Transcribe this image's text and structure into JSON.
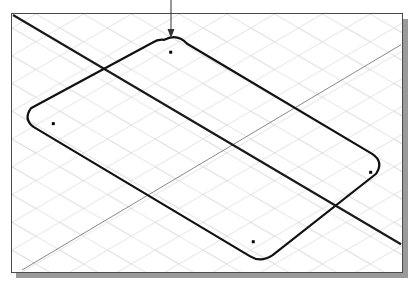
{
  "app": {
    "view_title": "Isometric Sketch View",
    "background_color": "#ffffff"
  },
  "viewport": {
    "name": "drawing-viewport",
    "page_color": "#ffffff",
    "border_color": "#4a4a4a",
    "shadow_color": "#9a9a9a",
    "x": 11,
    "y": 13,
    "width": 392,
    "height": 260
  },
  "grid": {
    "label": "isometric-grid",
    "color": "#d9dadd",
    "line_width": 0.8,
    "spacing_x": 24,
    "spacing_y": 14,
    "style": "diamond"
  },
  "construction_lines": [
    {
      "name": "axis-line-major",
      "color": "#1a1a1a",
      "width": 2.2,
      "x1": 1,
      "y1": 1,
      "x2": 391,
      "y2": 232
    },
    {
      "name": "axis-line-minor",
      "color": "#7a7a7a",
      "width": 0.9,
      "x1": 10,
      "y1": 258,
      "x2": 391,
      "y2": 31
    }
  ],
  "sketch": {
    "name": "rounded-rectangle-profile",
    "color": "#111111",
    "line_width": 2.2,
    "corner_radius": 26,
    "corners": [
      {
        "label": "top",
        "x": 161,
        "y": 25
      },
      {
        "label": "right",
        "x": 370,
        "y": 150
      },
      {
        "label": "bottom",
        "x": 250,
        "y": 247
      },
      {
        "label": "left",
        "x": 18,
        "y": 112
      }
    ]
  },
  "point_markers": [
    {
      "label": "point-top",
      "x": 170,
      "y": 51,
      "size": 3,
      "color": "#000000"
    },
    {
      "label": "point-left",
      "x": 52,
      "y": 123,
      "size": 3,
      "color": "#000000"
    },
    {
      "label": "point-right",
      "x": 371,
      "y": 172,
      "size": 3,
      "color": "#000000"
    },
    {
      "label": "point-bottom",
      "x": 253,
      "y": 242,
      "size": 3,
      "color": "#000000"
    }
  ],
  "arrow_annotation": {
    "name": "dimension-arrow",
    "color": "#333333",
    "width": 1,
    "x": 171,
    "y_start": 0,
    "y_end": 38,
    "head_width": 7,
    "head_height": 9
  }
}
